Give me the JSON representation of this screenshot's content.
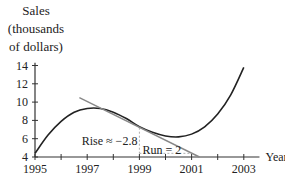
{
  "chart_data": {
    "type": "line",
    "title": "",
    "xlabel": "Year",
    "ylabel": "Sales (thousands of dollars)",
    "ylabel_lines": [
      "Sales",
      "(thousands",
      "of dollars)"
    ],
    "xlim": [
      1995,
      2003.5
    ],
    "ylim": [
      4,
      14
    ],
    "x_ticks": [
      1995,
      1996,
      1997,
      1998,
      1999,
      2000,
      2001,
      2002,
      2003
    ],
    "x_tick_labels": [
      "1995",
      "1997",
      "1999",
      "2001",
      "2003"
    ],
    "y_ticks": [
      4,
      6,
      8,
      10,
      12,
      14
    ],
    "y_tick_labels": [
      "4",
      "6",
      "8",
      "10",
      "12",
      "14"
    ],
    "grid": false,
    "series": [
      {
        "name": "Sales curve",
        "color": "#222222",
        "x": [
          1995,
          1995.5,
          1996,
          1996.5,
          1997,
          1997.5,
          1998,
          1998.5,
          1999,
          1999.5,
          2000,
          2000.5,
          2001,
          2001.5,
          2002,
          2002.5,
          2003
        ],
        "y": [
          4.4,
          6.4,
          7.9,
          8.9,
          9.3,
          9.3,
          8.9,
          8.2,
          7.3,
          6.7,
          6.3,
          6.2,
          6.5,
          7.3,
          8.7,
          10.8,
          13.8
        ]
      },
      {
        "name": "Tangent line at 1999",
        "color": "#888888",
        "x": [
          1996.7,
          2001.3
        ],
        "y": [
          10.5,
          4.0
        ]
      }
    ],
    "annotations": [
      {
        "text": "Rise ≈ −2.8",
        "x": 1999,
        "y": 5.8
      },
      {
        "text": "Run = 2",
        "x": 2000,
        "y": 4.7
      }
    ],
    "rise_run_triangle": {
      "x0": 1999,
      "y0": 7.2,
      "x1": 2001,
      "y1": 4.4
    }
  }
}
